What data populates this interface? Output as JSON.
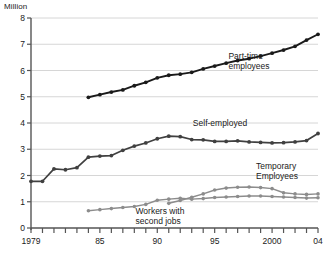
{
  "chart_data": {
    "type": "line",
    "title": "",
    "unit_label": "Million",
    "xlabel": "",
    "ylabel": "Million",
    "ylim": [
      0,
      8
    ],
    "yticks": [
      0,
      1,
      2,
      3,
      4,
      5,
      6,
      7,
      8
    ],
    "ytick_labels": [
      "0",
      "1",
      "2",
      "3",
      "4",
      "5",
      "6",
      "7",
      "8"
    ],
    "xlim": [
      1979,
      2004
    ],
    "xticks": [
      1979,
      1980,
      1981,
      1982,
      1983,
      1984,
      1985,
      1986,
      1987,
      1988,
      1989,
      1990,
      1991,
      1992,
      1993,
      1994,
      1995,
      1996,
      1997,
      1998,
      1999,
      2000,
      2001,
      2002,
      2003,
      2004
    ],
    "xtick_labels": [
      {
        "x": 1979,
        "label": "1979"
      },
      {
        "x": 1985,
        "label": "85"
      },
      {
        "x": 1990,
        "label": "90"
      },
      {
        "x": 1995,
        "label": "95"
      },
      {
        "x": 2000,
        "label": "2000"
      },
      {
        "x": 2004,
        "label": "04"
      }
    ],
    "grid": "horizontal",
    "legend_position": "inline-annotations",
    "series": [
      {
        "name": "Part-time employees",
        "color": "#1a1a1a",
        "marker": "circle",
        "label_x": 1996.2,
        "label_y": 6.45,
        "label_lines": [
          "Part-time",
          "employees"
        ],
        "x": [
          1984,
          1985,
          1986,
          1987,
          1988,
          1989,
          1990,
          1991,
          1992,
          1993,
          1994,
          1995,
          1996,
          1997,
          1998,
          1999,
          2000,
          2001,
          2002,
          2003,
          2004
        ],
        "values": [
          4.98,
          5.08,
          5.18,
          5.26,
          5.42,
          5.55,
          5.72,
          5.82,
          5.86,
          5.93,
          6.06,
          6.17,
          6.28,
          6.38,
          6.45,
          6.55,
          6.66,
          6.78,
          6.92,
          7.16,
          7.38
        ]
      },
      {
        "name": "Self-employed",
        "color": "#404040",
        "marker": "circle",
        "label_x": 1993.1,
        "label_y": 3.88,
        "label_lines": [
          "Self-employed"
        ],
        "x": [
          1979,
          1980,
          1981,
          1982,
          1983,
          1984,
          1985,
          1986,
          1987,
          1988,
          1989,
          1990,
          1991,
          1992,
          1993,
          1994,
          1995,
          1996,
          1997,
          1998,
          1999,
          2000,
          2001,
          2002,
          2003,
          2004
        ],
        "values": [
          1.78,
          1.78,
          2.25,
          2.22,
          2.3,
          2.7,
          2.74,
          2.76,
          2.96,
          3.12,
          3.24,
          3.4,
          3.5,
          3.48,
          3.37,
          3.36,
          3.3,
          3.3,
          3.32,
          3.28,
          3.26,
          3.24,
          3.25,
          3.28,
          3.33,
          3.6
        ]
      },
      {
        "name": "Temporary Employees",
        "color": "#8c8c8c",
        "marker": "circle",
        "label_x": 1998.6,
        "label_y": 2.25,
        "label_lines": [
          "Temporary",
          "Employees"
        ],
        "x": [
          1991,
          1992,
          1993,
          1994,
          1995,
          1996,
          1997,
          1998,
          1999,
          2000,
          2001,
          2002,
          2003,
          2004
        ],
        "values": [
          0.94,
          1.05,
          1.17,
          1.3,
          1.45,
          1.52,
          1.55,
          1.56,
          1.54,
          1.5,
          1.34,
          1.3,
          1.28,
          1.3
        ]
      },
      {
        "name": "Workers with second jobs",
        "color": "#8c8c8c",
        "marker": "circle",
        "label_x": 1988.1,
        "label_y": 0.52,
        "label_lines": [
          "Workers with",
          "second jobs"
        ],
        "x": [
          1984,
          1985,
          1986,
          1987,
          1988,
          1989,
          1990,
          1991,
          1992,
          1993,
          1994,
          1995,
          1996,
          1997,
          1998,
          1999,
          2000,
          2001,
          2002,
          2003,
          2004
        ],
        "values": [
          0.66,
          0.7,
          0.74,
          0.78,
          0.82,
          0.9,
          1.06,
          1.1,
          1.13,
          1.1,
          1.12,
          1.16,
          1.18,
          1.2,
          1.22,
          1.22,
          1.2,
          1.18,
          1.16,
          1.14,
          1.15
        ]
      }
    ],
    "colors": {
      "axis": "#555555",
      "grid": "#cccccc",
      "dark_series": "#1a1a1a",
      "mid_series": "#404040",
      "light_series": "#8c8c8c",
      "background": "#ffffff"
    }
  }
}
